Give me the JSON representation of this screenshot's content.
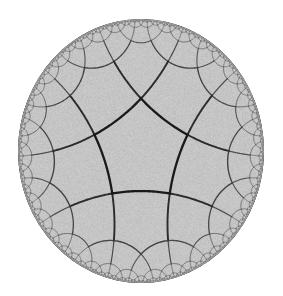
{
  "figure": {
    "caption": "",
    "kind": "hyperbolic-tessellation",
    "model": "Poincare disk"
  },
  "chart_data": {
    "type": "diagram",
    "schlafli_symbol": "{5,4}",
    "polygon_sides": 5,
    "vertex_valence": 4,
    "model": "Poincare disk",
    "recursion_depth": 7,
    "center_polygon_orientation_deg": -90
  },
  "canvas": {
    "width": 283,
    "height": 296,
    "background": "#ffffff"
  },
  "disk": {
    "center_x": 141,
    "center_y": 151,
    "radius_x": 123,
    "radius_y": 132,
    "fill": "#c9c9c9",
    "rim_stroke": "#9a9a9a",
    "rim_width": 1.4,
    "noise_opacity": 0.05
  },
  "edges": {
    "color_near": "#111111",
    "color_far": "#6d6d6d",
    "width_near": 2.5,
    "width_far": 0.45,
    "falloff": 2.1
  }
}
